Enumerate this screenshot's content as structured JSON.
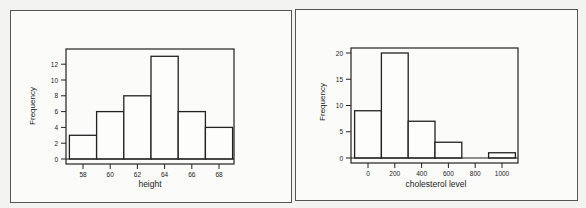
{
  "chart_data": [
    {
      "type": "bar",
      "subtype": "histogram",
      "title": "",
      "xlabel": "height",
      "ylabel": "Frequency",
      "bins": [
        [
          57,
          59
        ],
        [
          59,
          61
        ],
        [
          61,
          63
        ],
        [
          63,
          65
        ],
        [
          65,
          67
        ],
        [
          67,
          69
        ]
      ],
      "categories": [
        "57-59",
        "59-61",
        "61-63",
        "63-65",
        "65-67",
        "67-69"
      ],
      "values": [
        3,
        6,
        8,
        13,
        6,
        4
      ],
      "xticks": [
        58,
        60,
        62,
        64,
        66,
        68
      ],
      "yticks": [
        0,
        2,
        4,
        6,
        8,
        10,
        12
      ],
      "xlim": [
        56,
        69.2
      ],
      "ylim": [
        0,
        13.8
      ],
      "grid": false,
      "legend": null
    },
    {
      "type": "bar",
      "subtype": "histogram",
      "title": "",
      "xlabel": "cholesterol level",
      "ylabel": "Frequency",
      "bins": [
        [
          -100,
          100
        ],
        [
          100,
          300
        ],
        [
          300,
          500
        ],
        [
          500,
          700
        ],
        [
          700,
          900
        ],
        [
          900,
          1100
        ]
      ],
      "categories": [
        "-100-100",
        "100-300",
        "300-500",
        "500-700",
        "700-900",
        "900-1100"
      ],
      "values": [
        9,
        20,
        7,
        3,
        0,
        1
      ],
      "xticks": [
        0,
        200,
        400,
        600,
        800,
        1000
      ],
      "yticks": [
        0,
        5,
        10,
        15,
        20
      ],
      "xlim": [
        -125,
        1115
      ],
      "ylim": [
        0,
        21.5
      ],
      "grid": false,
      "legend": null
    }
  ],
  "charts": {
    "left": {
      "ylabel": "Frequency",
      "xlabel": "height",
      "xtick_labels": [
        "58",
        "60",
        "62",
        "64",
        "66",
        "68"
      ],
      "ytick_labels": [
        "0",
        "2",
        "4",
        "6",
        "8",
        "10",
        "12"
      ]
    },
    "right": {
      "ylabel": "Frequency",
      "xlabel": "cholesterol level",
      "xtick_labels": [
        "0",
        "200",
        "400",
        "600",
        "800",
        "1000"
      ],
      "ytick_labels": [
        "0",
        "5",
        "10",
        "15",
        "20"
      ]
    }
  }
}
